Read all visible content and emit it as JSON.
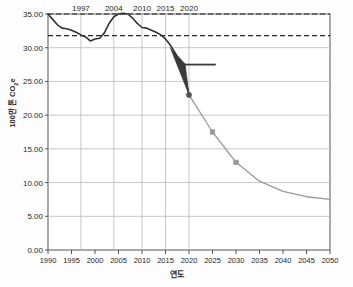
{
  "chart_data": {
    "type": "line",
    "title": "",
    "xlabel": "연도",
    "ylabel": "100만 톤 CO2e",
    "ylabel_main": "100만 톤 CO",
    "ylabel_sub": "2",
    "ylabel_tail": "e",
    "xlim": [
      1990,
      2050
    ],
    "ylim": [
      0.0,
      35.0
    ],
    "grid": true,
    "legend": "none",
    "y_ticks": [
      0.0,
      5.0,
      10.0,
      15.0,
      20.0,
      25.0,
      30.0,
      35.0
    ],
    "y_tick_labels": [
      "0.00",
      "5.00",
      "10.00",
      "15.00",
      "20.00",
      "25.00",
      "30.00",
      "35.00"
    ],
    "x_ticks": [
      1990,
      1995,
      2000,
      2005,
      2010,
      2015,
      2020,
      2025,
      2030,
      2035,
      2040,
      2045,
      2050
    ],
    "x_tick_labels": [
      "1990",
      "1995",
      "2000",
      "2005",
      "2010",
      "2015",
      "2020",
      "2025",
      "2030",
      "2035",
      "2040",
      "2045",
      "2050"
    ],
    "top_annotations": [
      {
        "label": "1997",
        "year": 1997
      },
      {
        "label": "2004",
        "year": 2004
      },
      {
        "label": "2010",
        "year": 2010
      },
      {
        "label": "2015",
        "year": 2015
      },
      {
        "label": "2020",
        "year": 2020
      }
    ],
    "vertical_gridline_years": [
      1997,
      2004,
      2010,
      2015,
      2020
    ],
    "reference_lines": [
      {
        "name": "upper-dashed-reference",
        "value": 35.0,
        "style": "dashed"
      },
      {
        "name": "lower-dashed-reference",
        "value": 31.8,
        "style": "dashed"
      }
    ],
    "series": [
      {
        "name": "historical-emissions",
        "style": "solid",
        "color": "#333333",
        "x": [
          1990,
          1991,
          1992,
          1993,
          1994,
          1995,
          1996,
          1997,
          1998,
          1999,
          2000,
          2001,
          2002,
          2003,
          2004,
          2005,
          2006,
          2007,
          2008,
          2009,
          2010,
          2011,
          2012,
          2013,
          2014,
          2015,
          2016,
          2017,
          2018,
          2019,
          2020
        ],
        "values": [
          35.0,
          34.2,
          33.4,
          32.9,
          32.8,
          32.6,
          32.3,
          31.9,
          31.6,
          31.0,
          31.3,
          31.4,
          32.2,
          33.6,
          34.6,
          35.0,
          35.1,
          35.0,
          34.4,
          33.6,
          33.0,
          32.9,
          32.6,
          32.3,
          31.9,
          31.3,
          30.4,
          29.3,
          28.0,
          26.3,
          23.0
        ]
      },
      {
        "name": "projected-emissions",
        "style": "solid",
        "color": "#9a9a9a",
        "markers": true,
        "x": [
          2020,
          2025,
          2030,
          2035,
          2040,
          2045,
          2050
        ],
        "values": [
          23.0,
          17.5,
          13.0,
          10.2,
          8.7,
          7.9,
          7.5
        ]
      }
    ],
    "markers": [
      {
        "year": 2020,
        "value": 23.0,
        "color": "#555555"
      },
      {
        "year": 2025,
        "value": 17.5,
        "color": "#9a9a9a"
      },
      {
        "year": 2030,
        "value": 13.0,
        "color": "#9a9a9a"
      }
    ],
    "annotations": [
      {
        "name": "reduction-wedge",
        "type": "filled-wedge",
        "color": "#3a3a3a",
        "points": [
          [
            2016.0,
            30.0
          ],
          [
            2020.0,
            23.0
          ],
          [
            2019.2,
            27.6
          ]
        ]
      },
      {
        "name": "target-level-bar",
        "type": "horizontal-bar",
        "color": "#3a3a3a",
        "value": 27.5,
        "x_start": 2019.0,
        "x_end": 2025.7
      }
    ]
  },
  "axis": {
    "y_axis_title": "100만 톤 CO2e",
    "x_axis_title": "연도"
  }
}
